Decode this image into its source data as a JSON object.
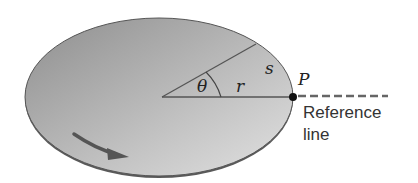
{
  "figure": {
    "labels": {
      "theta": "θ",
      "radius": "r",
      "arc_length": "s",
      "point": "P",
      "reference_line_1": "Reference",
      "reference_line_2": "line"
    },
    "colors": {
      "disk_dark": "#8a8a8a",
      "disk_light": "#d9d9d9",
      "edge": "#4a4a4a",
      "line": "#555555",
      "arrow": "#555555",
      "point": "#111111",
      "text": "#333333"
    }
  }
}
